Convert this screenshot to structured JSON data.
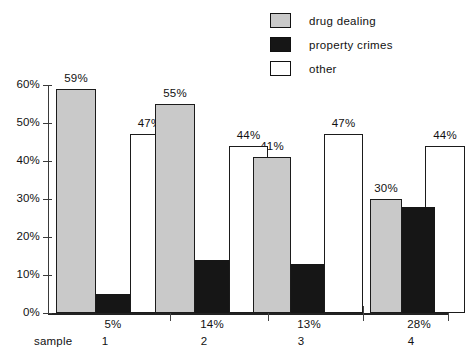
{
  "chart_data": {
    "type": "bar",
    "title": "",
    "xlabel": "sample",
    "ylabel": "",
    "ylim": [
      0,
      60
    ],
    "grid": false,
    "legend_position": "top-right",
    "categories": [
      "1",
      "2",
      "3",
      "4"
    ],
    "y_ticks": [
      "0%",
      "10%",
      "20%",
      "30%",
      "40%",
      "50%",
      "60%"
    ],
    "y_tick_values": [
      0,
      10,
      20,
      30,
      40,
      50,
      60
    ],
    "series": [
      {
        "name": "drug dealing",
        "color": "#c9c9c9",
        "values": [
          59,
          55,
          41,
          30
        ],
        "labels": [
          "59%",
          "55%",
          "41%",
          "30%"
        ],
        "label_position": "above"
      },
      {
        "name": "property crimes",
        "color": "#161616",
        "values": [
          5,
          14,
          13,
          28
        ],
        "labels": [
          "5%",
          "14%",
          "13%",
          "28%"
        ],
        "label_position": "below-axis"
      },
      {
        "name": "other",
        "color": "#ffffff",
        "values": [
          47,
          44,
          47,
          44
        ],
        "labels": [
          "47%",
          "44%",
          "47%",
          "44%"
        ],
        "label_position": "above"
      }
    ]
  },
  "legend": {
    "items": [
      {
        "label": "drug dealing"
      },
      {
        "label": "property crimes"
      },
      {
        "label": "other"
      }
    ]
  },
  "axis": {
    "sample_label": "sample"
  }
}
